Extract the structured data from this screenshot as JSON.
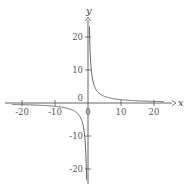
{
  "chart_data": {
    "type": "line",
    "title": "",
    "xlabel": "x",
    "ylabel": "y",
    "function": "y = 10/x",
    "xlim": [
      -25,
      25
    ],
    "ylim": [
      -25,
      25
    ],
    "grid": false,
    "legend": null,
    "x_ticks": [
      -20,
      -10,
      0,
      10,
      20
    ],
    "y_ticks": [
      -20,
      -10,
      0,
      10,
      20
    ],
    "x_tick_labels": [
      "-20",
      "-10",
      "0",
      "10",
      "20"
    ],
    "y_tick_labels": [
      "20",
      "10",
      "0",
      "-10",
      "-20"
    ],
    "series": [
      {
        "name": "y = 10/x (positive branch)",
        "x": [
          0.43,
          0.5,
          1,
          2,
          3,
          5,
          10,
          15,
          20,
          23
        ],
        "y": [
          23.3,
          20,
          10,
          5,
          3.33,
          2,
          1,
          0.67,
          0.5,
          0.43
        ]
      },
      {
        "name": "y = 10/x (negative branch)",
        "x": [
          -23,
          -20,
          -15,
          -10,
          -5,
          -3,
          -2,
          -1,
          -0.5,
          -0.43
        ],
        "y": [
          -0.43,
          -0.5,
          -0.67,
          -1,
          -2,
          -3.33,
          -5,
          -10,
          -20,
          -23.3
        ]
      }
    ],
    "colors": {
      "axis": "#555555",
      "curve": "#555555",
      "ticks": "#555555"
    }
  }
}
